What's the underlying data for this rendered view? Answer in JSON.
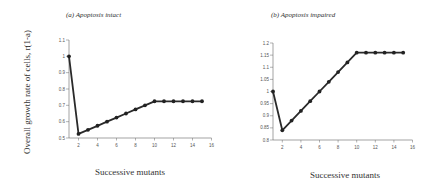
{
  "shared": {
    "ylabel": "Overall growth rate of cells, r(1-a)"
  },
  "chart_data": [
    {
      "type": "line",
      "title": "(a) Apoptosis intact",
      "xlabel": "Successive mutants",
      "ylabel": "Overall growth rate of cells, r(1-a)",
      "x": [
        1,
        2,
        3,
        4,
        5,
        6,
        7,
        8,
        9,
        10,
        11,
        12,
        13,
        14,
        15
      ],
      "values": [
        1.0,
        0.525,
        0.55,
        0.575,
        0.6,
        0.625,
        0.65,
        0.675,
        0.7,
        0.725,
        0.725,
        0.725,
        0.725,
        0.725,
        0.725
      ],
      "xlim": [
        1,
        16
      ],
      "ylim": [
        0.5,
        1.1
      ],
      "xticks": [
        "2",
        "4",
        "6",
        "8",
        "10",
        "12",
        "14",
        "16"
      ],
      "yticks": [
        "0.5",
        "0.6",
        "0.7",
        "0.8",
        "0.9",
        "1",
        "1.1"
      ],
      "grid": false,
      "legend": null
    },
    {
      "type": "line",
      "title": "(b) Apoptosis impaired",
      "xlabel": "Successive mutants",
      "ylabel": "Overall growth rate of cells, r(1-a)",
      "x": [
        1,
        2,
        3,
        4,
        5,
        6,
        7,
        8,
        9,
        10,
        11,
        12,
        13,
        14,
        15
      ],
      "values": [
        1.0,
        0.84,
        0.88,
        0.92,
        0.96,
        1.0,
        1.04,
        1.08,
        1.12,
        1.16,
        1.16,
        1.16,
        1.16,
        1.16,
        1.16
      ],
      "xlim": [
        1,
        16
      ],
      "ylim": [
        0.8,
        1.2
      ],
      "xticks": [
        "2",
        "4",
        "6",
        "8",
        "10",
        "12",
        "14",
        "16"
      ],
      "yticks": [
        "0.8",
        "0.85",
        "0.9",
        "0.95",
        "1",
        "1.05",
        "1.1",
        "1.15",
        "1.2"
      ],
      "grid": false,
      "legend": null
    }
  ]
}
